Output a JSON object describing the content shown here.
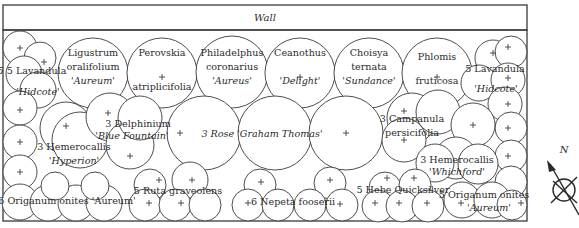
{
  "diagram": {
    "type": "planting-plan",
    "wall_label": "Wall",
    "compass_label": "N",
    "plants": [
      {
        "id": "lavandula-left",
        "qty": "5",
        "lines": [
          "Lavandula",
          "'Hidcote'"
        ]
      },
      {
        "id": "ligustrum",
        "qty": "",
        "lines": [
          "Ligustrum",
          "oralifolium",
          "'Aureum'"
        ]
      },
      {
        "id": "perovskia",
        "qty": "",
        "lines": [
          "Perovskia",
          "+",
          "atriplicifolia"
        ]
      },
      {
        "id": "philadelphus",
        "qty": "",
        "lines": [
          "Philadelphus",
          "coronarius",
          "'Aureus'"
        ]
      },
      {
        "id": "ceanothus",
        "qty": "",
        "lines": [
          "Ceanothus",
          "+",
          "'Delight'"
        ]
      },
      {
        "id": "choisya",
        "qty": "",
        "lines": [
          "Choisya",
          "ternata",
          "'Sundance'"
        ]
      },
      {
        "id": "phlomis",
        "qty": "",
        "lines": [
          "Phlomis",
          "+",
          "fruticosa"
        ]
      },
      {
        "id": "lavandula-right",
        "qty": "5",
        "lines": [
          "Lavandula",
          "'Hidcote'"
        ]
      },
      {
        "id": "delphinium",
        "qty": "3",
        "lines": [
          "Delphinium",
          "'Blue Fountain'"
        ]
      },
      {
        "id": "hemerocallis-hyperion",
        "qty": "3",
        "lines": [
          "Hemerocallis",
          "'Hyperion'"
        ]
      },
      {
        "id": "rose",
        "qty": "3",
        "lines": [
          "Rose 'Graham Thomas'"
        ]
      },
      {
        "id": "campanula",
        "qty": "3",
        "lines": [
          "Campanula",
          "persicifolia"
        ]
      },
      {
        "id": "hemerocallis-whichford",
        "qty": "3",
        "lines": [
          "Hemerocallis",
          "'Whichford'"
        ]
      },
      {
        "id": "origanum-left",
        "qty": "6",
        "lines": [
          "Origanum onites 'Aureum'"
        ]
      },
      {
        "id": "ruta",
        "qty": "5",
        "lines": [
          "Ruta graveolens"
        ]
      },
      {
        "id": "nepeta",
        "qty": "6",
        "lines": [
          "Nepeta fooserii"
        ]
      },
      {
        "id": "hebe",
        "qty": "5",
        "lines": [
          "Hebe Quicksilver"
        ]
      },
      {
        "id": "origanum-right",
        "qty": "5",
        "lines": [
          "Origanum onites",
          "'Aureum'"
        ]
      }
    ],
    "labels": {
      "lav_l_name": "5 Lavandula",
      "lav_l_cv": "'Hidcote'",
      "lig_1": "Ligustrum",
      "lig_2": "oralifolium",
      "lig_3": "'Aureum'",
      "per_1": "Perovskia",
      "per_2": "atriplicifolia",
      "phi_1": "Philadelphus",
      "phi_2": "coronarius",
      "phi_3": "'Aureus'",
      "cea_1": "Ceanothus",
      "cea_2": "'Delight'",
      "cho_1": "Choisya",
      "cho_2": "ternata",
      "cho_3": "'Sundance'",
      "phl_1": "Phlomis",
      "phl_2": "fruticosa",
      "lav_r_name": "5 Lavandula",
      "lav_r_cv": "'Hidcote'",
      "del_1": "3 Delphinium",
      "del_2": "'Blue Fountain'",
      "hyp_1": "3 Hemerocallis",
      "hyp_2": "'Hyperion'",
      "rose": "3 Rose 'Graham Thomas'",
      "cam_1": "3 Campanula",
      "cam_2": "persicifolia",
      "whi_1": "3 Hemerocallis",
      "whi_2": "'Whichford'",
      "ori_l": "6 Origanum onites 'Aureum'",
      "ruta": "5 Ruta graveolens",
      "nep": "6 Nepeta fooserii",
      "hebe": "5 Hebe Quicksilver",
      "ori_r_1": "5 Origanum onites",
      "ori_r_2": "'Aureum'"
    }
  }
}
